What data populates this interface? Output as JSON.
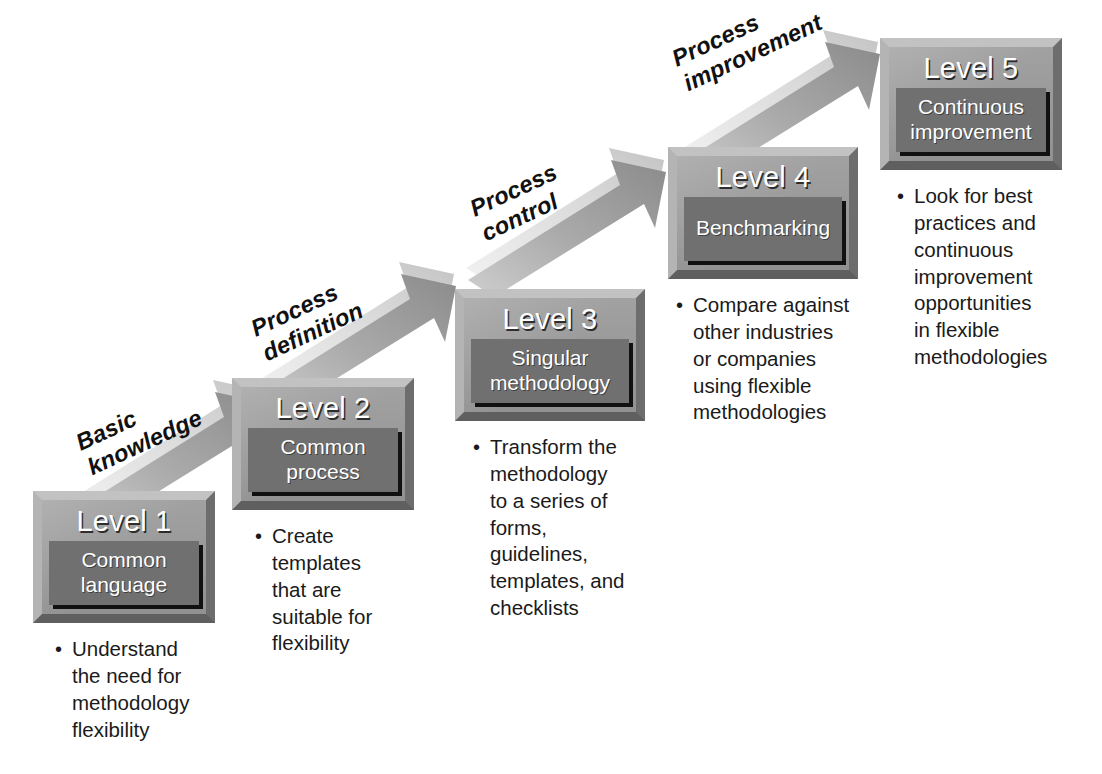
{
  "diagram": {
    "colors": {
      "box_frame": "#9a9a9a",
      "box_inner": "#707070",
      "arrow_body": "#9e9e9e",
      "arrow_top": "#d8d8d8",
      "text_dark": "#1a1a1a",
      "text_light": "#ffffff",
      "background": "#ffffff"
    },
    "levels": [
      {
        "title": "Level 1",
        "subtitle_lines": [
          "Common",
          "language"
        ],
        "bullets": [
          "Understand the need for methodology flexibility"
        ],
        "bullet_lines": [
          [
            "Understand",
            "the need for",
            "methodology",
            "flexibility"
          ]
        ]
      },
      {
        "title": "Level 2",
        "subtitle_lines": [
          "Common",
          "process"
        ],
        "bullets": [
          "Create templates that are suitable for flexibility"
        ],
        "bullet_lines": [
          [
            "Create",
            "templates",
            "that are",
            "suitable for",
            "flexibility"
          ]
        ]
      },
      {
        "title": "Level 3",
        "subtitle_lines": [
          "Singular",
          "methodology"
        ],
        "bullets": [
          "Transform the methodology to a series of forms, guidelines, templates, and checklists"
        ],
        "bullet_lines": [
          [
            "Transform the",
            "methodology",
            "to a series of",
            "forms,",
            "guidelines,",
            "templates, and",
            "checklists"
          ]
        ]
      },
      {
        "title": "Level 4",
        "subtitle_lines": [
          "Benchmarking"
        ],
        "bullets": [
          "Compare against other industries or companies using flexible methodologies"
        ],
        "bullet_lines": [
          [
            "Compare against",
            "other industries",
            "or companies",
            "using flexible",
            "methodologies"
          ]
        ]
      },
      {
        "title": "Level 5",
        "subtitle_lines": [
          "Continuous",
          "improvement"
        ],
        "bullets": [
          "Look for best practices and continuous improvement opportunities in flexible methodologies"
        ],
        "bullet_lines": [
          [
            "Look for best",
            "practices and",
            "continuous",
            "improvement",
            "opportunities",
            "in flexible",
            "methodologies"
          ]
        ]
      }
    ],
    "transitions": [
      {
        "label": "Basic knowledge",
        "lines": [
          "Basic",
          "knowledge"
        ],
        "from": "Level 1",
        "to": "Level 2"
      },
      {
        "label": "Process definition",
        "lines": [
          "Process",
          "definition"
        ],
        "from": "Level 2",
        "to": "Level 3"
      },
      {
        "label": "Process control",
        "lines": [
          "Process",
          "control"
        ],
        "from": "Level 3",
        "to": "Level 4"
      },
      {
        "label": "Process improvement",
        "lines": [
          "Process",
          "improvement"
        ],
        "from": "Level 4",
        "to": "Level 5"
      }
    ]
  }
}
